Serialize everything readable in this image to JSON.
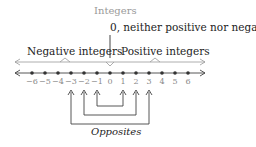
{
  "diagram": {
    "title": "Integers",
    "zero_label": "0, neither positive nor negative",
    "negative_label": "Negative integers",
    "positive_label": "Positive integers",
    "opposites_label": "Opposites",
    "number_line": {
      "ticks": [
        "−6",
        "−5",
        "−4",
        "−3",
        "−2",
        "−1",
        "0",
        "1",
        "2",
        "3",
        "4",
        "5",
        "6"
      ],
      "min": -6,
      "max": 6
    },
    "opposite_pairs": [
      [
        -1,
        1
      ],
      [
        -2,
        2
      ],
      [
        -3,
        3
      ]
    ],
    "colors": {
      "line": "#444444",
      "title": "#9a9a9a",
      "tick_label": "#8a8a8a",
      "brace_line": "#999999"
    }
  }
}
